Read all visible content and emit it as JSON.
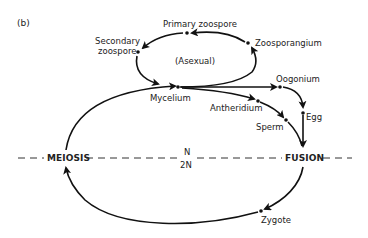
{
  "figure": {
    "panel_label": "(b)",
    "asexual_label": "(Asexual)",
    "ploidy": {
      "haploid": "N",
      "diploid": "2N"
    },
    "events": {
      "meiosis": "MEIOSIS",
      "fusion": "FUSION"
    },
    "stages": {
      "primary_zoospore": "Primary zoospore",
      "zoosporangium": "Zoosporangium",
      "secondary_zoospore_line1": "Secondary",
      "secondary_zoospore_line2": "zoospore",
      "mycelium": "Mycelium",
      "oogonium": "Oogonium",
      "antheridium": "Antheridium",
      "sperm": "Sperm",
      "egg": "Egg",
      "zygote": "Zygote"
    },
    "colors": {
      "line": "#111111",
      "text": "#222222",
      "background": "#ffffff"
    }
  }
}
